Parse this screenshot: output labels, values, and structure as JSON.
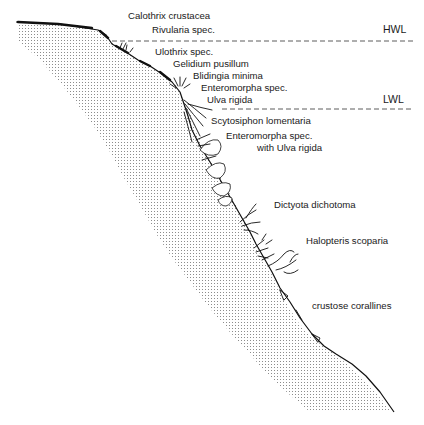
{
  "figure": {
    "type": "intertidal zonation profile of a rocky shore",
    "water_levels": [
      {
        "id": "hwl",
        "label": "HWL"
      },
      {
        "id": "lwl",
        "label": "LWL"
      }
    ],
    "species_labels": {
      "calothrix": "Calothrix crustacea",
      "rivularia": "Rivularia spec.",
      "ulothrix": "Ulothrix spec.",
      "gelidium": "Gelidium pusillum",
      "blidingia": "Blidingia minima",
      "enteromorpha1": "Enteromorpha spec.",
      "ulva": "Ulva rigida",
      "scytosiphon": "Scytosiphon lomentaria",
      "enteromorpha2_line1": "Enteromorpha spec.",
      "enteromorpha2_line2": "with Ulva rigida",
      "dictyota": "Dictyota dichotoma",
      "halopteris": "Halopteris scoparia",
      "corallines": "crustose corallines"
    },
    "zones": [
      {
        "zone": "supralittoral",
        "species": [
          "Calothrix crustacea",
          "Rivularia spec."
        ]
      },
      {
        "zone": "eulittoral",
        "species": [
          "Ulothrix spec.",
          "Gelidium pusillum",
          "Blidingia minima",
          "Enteromorpha spec.",
          "Ulva rigida"
        ]
      },
      {
        "zone": "sublittoral",
        "species": [
          "Scytosiphon lomentaria",
          "Enteromorpha spec. with Ulva rigida",
          "Dictyota dichotoma",
          "Halopteris scoparia",
          "crustose corallines"
        ]
      }
    ],
    "colors": {
      "ink": "#111111",
      "stipple": "#9a9a9a",
      "background": "#ffffff"
    }
  }
}
